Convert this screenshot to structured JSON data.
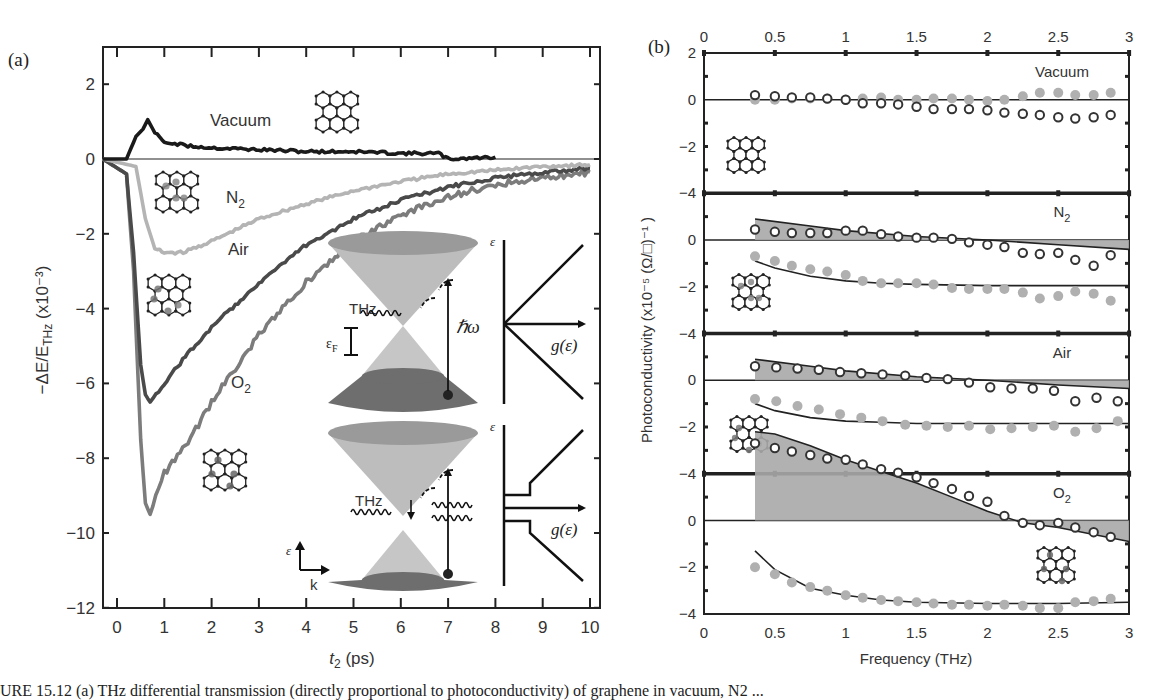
{
  "figure": {
    "caption_fragment": "URE 15.12 (a) THz differential transmission (directly proportional to photoconductivity) of graphene in vacuum, N2 ..."
  },
  "chart_data": [
    {
      "panel": "(a)",
      "type": "line",
      "title": "",
      "xlabel": "t2 (ps)",
      "ylabel": "−ΔE/E_THz (×10^-3)",
      "xlim": [
        -0.3,
        10
      ],
      "ylim": [
        -12,
        3
      ],
      "xticks": [
        0,
        1,
        2,
        3,
        4,
        5,
        6,
        7,
        8,
        9,
        10
      ],
      "yticks": [
        2,
        0,
        -2,
        -4,
        -6,
        -8,
        -10,
        -12
      ],
      "grid": false,
      "legend": "inline labels",
      "series": [
        {
          "name": "Vacuum",
          "color": "#1a1a1a",
          "x": [
            -0.3,
            0.2,
            0.4,
            0.55,
            0.65,
            0.8,
            1.0,
            1.5,
            2.0,
            3.0,
            4.0,
            5.0,
            6.0,
            6.8,
            7.0,
            8.0
          ],
          "y": [
            0,
            0,
            0.6,
            0.8,
            1.05,
            0.7,
            0.45,
            0.35,
            0.3,
            0.25,
            0.2,
            0.2,
            0.15,
            0.15,
            0.0,
            0.05
          ]
        },
        {
          "name": "N2",
          "color": "#b4b4b4",
          "x": [
            -0.3,
            0.4,
            0.6,
            0.8,
            1.0,
            1.4,
            2.0,
            3.0,
            4.0,
            5.0,
            6.0,
            7.0,
            8.0,
            9.0,
            10.0
          ],
          "y": [
            0,
            -0.2,
            -1.6,
            -2.4,
            -2.5,
            -2.5,
            -2.2,
            -1.6,
            -1.2,
            -0.85,
            -0.6,
            -0.4,
            -0.3,
            -0.2,
            -0.15
          ]
        },
        {
          "name": "Air",
          "color": "#4a4a4a",
          "x": [
            -0.3,
            0.2,
            0.35,
            0.5,
            0.6,
            0.7,
            1.0,
            1.5,
            2.0,
            3.0,
            4.0,
            5.0,
            6.0,
            7.0,
            8.0,
            9.0,
            10.0
          ],
          "y": [
            0,
            -0.4,
            -2.5,
            -5.5,
            -6.3,
            -6.5,
            -6.0,
            -5.2,
            -4.5,
            -3.3,
            -2.3,
            -1.6,
            -1.1,
            -0.75,
            -0.5,
            -0.35,
            -0.25
          ]
        },
        {
          "name": "O2",
          "color": "#7c7c7c",
          "x": [
            -0.3,
            0.2,
            0.35,
            0.5,
            0.6,
            0.7,
            1.0,
            1.5,
            2.0,
            3.0,
            4.0,
            5.0,
            6.0,
            7.0,
            8.0,
            9.0,
            10.0
          ],
          "y": [
            0,
            -0.4,
            -3.0,
            -7.5,
            -9.2,
            -9.5,
            -8.4,
            -7.6,
            -6.5,
            -4.7,
            -3.3,
            -2.2,
            -1.5,
            -1.0,
            -0.7,
            -0.5,
            -0.35
          ]
        }
      ],
      "annotations": [
        "Vacuum",
        "N2",
        "Air",
        "O2",
        "THz",
        "ħω",
        "εF",
        "ε",
        "g(ε)",
        "k"
      ]
    },
    {
      "panel": "(b)",
      "type": "scatter",
      "xlabel": "Frequency (THz)",
      "ylabel": "Photoconductivity (×10^-5 (Ω/□)^-1)",
      "xlim": [
        0,
        3
      ],
      "xticks": [
        0,
        0.5,
        1,
        1.5,
        2,
        2.5,
        3
      ],
      "ylim_per_subpanel": [
        -4,
        2
      ],
      "yticks": [
        2,
        0,
        -2,
        -4
      ],
      "subpanels": [
        {
          "name": "Vacuum",
          "freq": [
            0.36,
            0.5,
            0.62,
            0.75,
            0.87,
            1.0,
            1.12,
            1.25,
            1.37,
            1.5,
            1.62,
            1.75,
            1.87,
            2.0,
            2.12,
            2.25,
            2.37,
            2.5,
            2.62,
            2.75,
            2.87
          ],
          "real": [
            0.2,
            0.15,
            0.1,
            0.1,
            0.05,
            0.0,
            -0.15,
            -0.15,
            -0.2,
            -0.3,
            -0.4,
            -0.4,
            -0.4,
            -0.45,
            -0.55,
            -0.6,
            -0.65,
            -0.75,
            -0.8,
            -0.75,
            -0.65
          ],
          "imag": [
            0.0,
            0.0,
            0.05,
            0.05,
            0.05,
            0.0,
            0.05,
            0.1,
            0.0,
            0.0,
            0.05,
            0.05,
            0.0,
            -0.05,
            0.0,
            0.15,
            0.3,
            0.3,
            0.2,
            0.2,
            0.3
          ],
          "fit_real": null,
          "fit_imag": null
        },
        {
          "name": "N2",
          "freq": [
            0.36,
            0.5,
            0.62,
            0.75,
            0.87,
            1.0,
            1.12,
            1.25,
            1.37,
            1.5,
            1.62,
            1.75,
            1.87,
            2.0,
            2.12,
            2.25,
            2.37,
            2.5,
            2.62,
            2.75,
            2.87
          ],
          "real": [
            0.45,
            0.35,
            0.3,
            0.3,
            0.3,
            0.4,
            0.4,
            0.25,
            0.15,
            0.1,
            0.1,
            0.05,
            -0.1,
            -0.2,
            -0.3,
            -0.55,
            -0.6,
            -0.55,
            -0.85,
            -1.1,
            -0.65
          ],
          "imag": [
            -0.7,
            -0.9,
            -1.1,
            -1.25,
            -1.35,
            -1.5,
            -1.75,
            -1.85,
            -1.85,
            -1.85,
            -1.9,
            -2.05,
            -2.1,
            -2.1,
            -2.1,
            -2.25,
            -2.5,
            -2.4,
            -2.2,
            -2.3,
            -2.6
          ],
          "fit_real": {
            "x": [
              0.36,
              0.75,
              1.0,
              1.5,
              2.0,
              2.5,
              3.0
            ],
            "y": [
              0.9,
              0.6,
              0.4,
              0.15,
              0.0,
              -0.2,
              -0.4
            ]
          },
          "fit_imag": {
            "x": [
              0.36,
              0.5,
              0.75,
              1.0,
              1.25,
              1.5,
              2.0,
              2.5,
              3.0
            ],
            "y": [
              -0.9,
              -1.2,
              -1.55,
              -1.75,
              -1.85,
              -1.9,
              -1.95,
              -1.95,
              -1.95
            ]
          }
        },
        {
          "name": "Air",
          "freq": [
            0.36,
            0.51,
            0.66,
            0.81,
            0.96,
            1.11,
            1.26,
            1.42,
            1.57,
            1.72,
            1.87,
            2.02,
            2.17,
            2.32,
            2.47,
            2.62,
            2.77,
            2.92
          ],
          "real": [
            0.6,
            0.55,
            0.5,
            0.45,
            0.35,
            0.3,
            0.25,
            0.2,
            0.1,
            0.05,
            -0.1,
            -0.3,
            -0.35,
            -0.35,
            -0.45,
            -0.9,
            -0.75,
            -0.9
          ],
          "imag": [
            -0.8,
            -0.9,
            -1.1,
            -1.25,
            -1.45,
            -1.6,
            -1.75,
            -1.9,
            -1.95,
            -2.0,
            -1.95,
            -2.1,
            -2.05,
            -2.0,
            -1.95,
            -2.2,
            -2.05,
            -1.75
          ],
          "fit_real": {
            "x": [
              0.36,
              0.75,
              1.0,
              1.5,
              2.0,
              2.5,
              3.0
            ],
            "y": [
              0.9,
              0.6,
              0.4,
              0.15,
              0.0,
              -0.2,
              -0.35
            ]
          },
          "fit_imag": {
            "x": [
              0.36,
              0.5,
              0.75,
              1.0,
              1.25,
              1.5,
              2.0,
              2.5,
              3.0
            ],
            "y": [
              -1.0,
              -1.3,
              -1.6,
              -1.75,
              -1.8,
              -1.85,
              -1.85,
              -1.85,
              -1.85
            ]
          }
        },
        {
          "name": "O2",
          "freq": [
            0.36,
            0.5,
            0.62,
            0.75,
            0.87,
            1.0,
            1.12,
            1.25,
            1.37,
            1.5,
            1.62,
            1.75,
            1.87,
            2.0,
            2.12,
            2.25,
            2.37,
            2.5,
            2.62,
            2.75,
            2.87
          ],
          "real": [
            3.3,
            3.1,
            2.95,
            2.8,
            2.65,
            2.6,
            2.4,
            2.2,
            2.05,
            1.85,
            1.6,
            1.35,
            1.05,
            0.8,
            0.2,
            -0.1,
            -0.2,
            -0.1,
            -0.3,
            -0.5,
            -0.7
          ],
          "imag": [
            -2.0,
            -2.3,
            -2.65,
            -2.85,
            -3.0,
            -3.2,
            -3.3,
            -3.4,
            -3.45,
            -3.5,
            -3.55,
            -3.6,
            -3.6,
            -3.65,
            -3.6,
            -3.65,
            -3.75,
            -3.75,
            -3.5,
            -3.45,
            -3.35
          ],
          "fit_real": {
            "x": [
              0.36,
              0.5,
              0.75,
              1.0,
              1.25,
              1.5,
              1.75,
              2.0,
              2.25,
              2.5,
              3.0
            ],
            "y": [
              3.8,
              3.7,
              3.2,
              2.6,
              2.1,
              1.6,
              1.0,
              0.4,
              -0.1,
              -0.3,
              -0.9
            ]
          },
          "fit_imag": {
            "x": [
              0.36,
              0.5,
              0.75,
              1.0,
              1.25,
              1.5,
              2.0,
              2.5,
              3.0
            ],
            "y": [
              -1.3,
              -2.1,
              -2.9,
              -3.2,
              -3.4,
              -3.5,
              -3.55,
              -3.55,
              -3.5
            ]
          }
        }
      ],
      "legend": "open circles = real part, filled grey circles = imaginary part, lines = model fit (shaded = real)"
    }
  ],
  "labels": {
    "panel_a": "(a)",
    "panel_b": "(b)",
    "a_xlabel": "(ps)",
    "a_xlabel_var": "t",
    "a_xlabel_sub": "2",
    "b_xlabel": "Frequency (THz)",
    "b_ylabel": "Photoconductivity (x10⁻⁵ (Ω/□)⁻¹ )",
    "a_ylabel": "−ΔE/E",
    "a_ylabel_sub": "THz",
    "a_ylabel_tail": " (x10⁻³)",
    "vacuum": "Vacuum",
    "n2": "N",
    "air": "Air",
    "o2": "O",
    "sub2": "2",
    "thz": "THz",
    "hbar_omega": "ℏω",
    "eps": "ε",
    "eps_f": "ε",
    "eps_f_sub": "F",
    "g_eps": "g(ε)",
    "k": "k"
  }
}
